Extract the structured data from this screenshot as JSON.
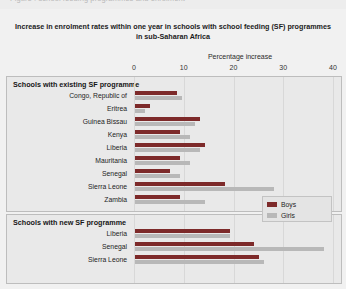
{
  "page": {
    "cut_off_header": "Figure : school feeding programmes and enrolment",
    "background_color": "#f1f1f1"
  },
  "legend": {
    "position": "bottom-right",
    "entries": [
      {
        "label": "Boys",
        "color": "#7d2a2a"
      },
      {
        "label": "Girls",
        "color": "#b8b8b8"
      }
    ]
  },
  "chart_data": {
    "type": "bar",
    "orientation": "horizontal",
    "title": "Increase in enrolment rates within one year in schools with school feeding (SF) programmes in sub-Saharan Africa",
    "xlabel": "Percentage increase",
    "ylabel": "",
    "xlim": [
      0,
      40
    ],
    "xticks": [
      0,
      10,
      20,
      30,
      40
    ],
    "xtick_labels": [
      "0",
      "10",
      "20",
      "30",
      "40"
    ],
    "grid": true,
    "legend_position": "bottom-right",
    "series": [
      {
        "name": "Boys",
        "color": "#7d2a2a"
      },
      {
        "name": "Girls",
        "color": "#b8b8b8"
      }
    ],
    "panels": [
      {
        "title": "Schools with existing SF programme",
        "categories": [
          "Congo, Republic of",
          "Eritrea",
          "Guinea Bissau",
          "Kenya",
          "Liberia",
          "Mauritania",
          "Senegal",
          "Sierra Leone",
          "Zambia"
        ],
        "series": [
          {
            "name": "Boys",
            "values": [
              8.5,
              3.0,
              13.0,
              9.0,
              14.0,
              9.0,
              7.0,
              18.0,
              9.0
            ]
          },
          {
            "name": "Girls",
            "values": [
              9.5,
              2.0,
              12.0,
              11.0,
              13.0,
              11.0,
              9.0,
              28.0,
              14.0
            ]
          }
        ]
      },
      {
        "title": "Schools with new SF programme",
        "categories": [
          "Liberia",
          "Senegal",
          "Sierra Leone"
        ],
        "series": [
          {
            "name": "Boys",
            "values": [
              19.0,
              24.0,
              25.0
            ]
          },
          {
            "name": "Girls",
            "values": [
              19.0,
              38.0,
              26.0
            ]
          }
        ]
      }
    ]
  }
}
